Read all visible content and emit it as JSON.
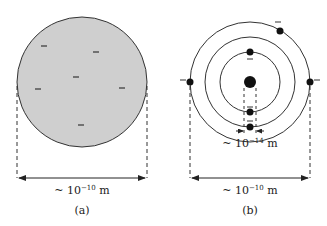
{
  "diagram_a": {
    "caption": "(a)",
    "width_label_prefix": "~ 10",
    "width_label_exp": "−10",
    "width_label_unit": " m",
    "charge_symbol": "−",
    "fill_color": "#cfcfcf",
    "charges_count": 6
  },
  "diagram_b": {
    "caption": "(b)",
    "nucleus_label_prefix": "~ 10",
    "nucleus_label_exp": "−14",
    "nucleus_label_unit": " m",
    "width_label_prefix": "~ 10",
    "width_label_exp": "−10",
    "width_label_unit": " m",
    "charge_symbol": "−",
    "orbit_count": 3,
    "electron_count": 6
  }
}
